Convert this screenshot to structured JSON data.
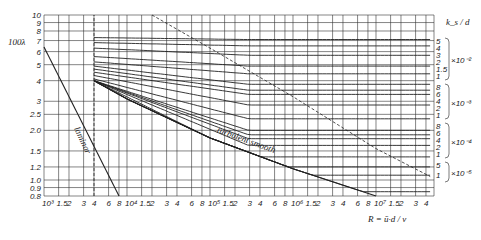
{
  "chart_data": {
    "type": "line",
    "title": "",
    "xlabel": "R = ū·d / ν",
    "ylabel": "100λ",
    "xscale": "log",
    "yscale": "log",
    "xlim": [
      1000,
      50000000
    ],
    "ylim": [
      0.8,
      10
    ],
    "grid": true,
    "x_ticks": [
      {
        "v": 1000,
        "label": "10³"
      },
      {
        "v": 1500,
        "label": "1.5"
      },
      {
        "v": 2000,
        "label": "2"
      },
      {
        "v": 3000,
        "label": "3"
      },
      {
        "v": 4000,
        "label": "4"
      },
      {
        "v": 6000,
        "label": "6"
      },
      {
        "v": 8000,
        "label": "8"
      },
      {
        "v": 10000,
        "label": "10⁴"
      },
      {
        "v": 15000,
        "label": "1.5"
      },
      {
        "v": 20000,
        "label": "2"
      },
      {
        "v": 30000,
        "label": "3"
      },
      {
        "v": 40000,
        "label": "4"
      },
      {
        "v": 60000,
        "label": "6"
      },
      {
        "v": 80000,
        "label": "8"
      },
      {
        "v": 100000,
        "label": "10⁵"
      },
      {
        "v": 150000,
        "label": "1.5"
      },
      {
        "v": 200000,
        "label": "2"
      },
      {
        "v": 300000,
        "label": "3"
      },
      {
        "v": 400000,
        "label": "4"
      },
      {
        "v": 600000,
        "label": "6"
      },
      {
        "v": 800000,
        "label": "8"
      },
      {
        "v": 1000000,
        "label": "10⁶"
      },
      {
        "v": 1500000,
        "label": "1.5"
      },
      {
        "v": 2000000,
        "label": "2"
      },
      {
        "v": 3000000,
        "label": "3"
      },
      {
        "v": 4000000,
        "label": "4"
      },
      {
        "v": 6000000,
        "label": "6"
      },
      {
        "v": 8000000,
        "label": "8"
      },
      {
        "v": 10000000,
        "label": "10⁷"
      },
      {
        "v": 15000000,
        "label": "1.5"
      },
      {
        "v": 20000000,
        "label": "2"
      },
      {
        "v": 30000000,
        "label": "3"
      },
      {
        "v": 40000000,
        "label": "4"
      }
    ],
    "y_ticks": [
      {
        "v": 10,
        "label": "10"
      },
      {
        "v": 9,
        "label": "9"
      },
      {
        "v": 8,
        "label": "8"
      },
      {
        "v": 7,
        "label": "7"
      },
      {
        "v": 6,
        "label": "6"
      },
      {
        "v": 5,
        "label": "5"
      },
      {
        "v": 4,
        "label": "4"
      },
      {
        "v": 3,
        "label": "3"
      },
      {
        "v": 2.5,
        "label": "2.5"
      },
      {
        "v": 2.0,
        "label": "2.0"
      },
      {
        "v": 1.5,
        "label": "1.5"
      },
      {
        "v": 1.2,
        "label": "1.2"
      },
      {
        "v": 1.0,
        "label": "1.0"
      },
      {
        "v": 0.9,
        "label": "0.9"
      },
      {
        "v": 0.8,
        "label": "0.8"
      }
    ],
    "right_axis": {
      "title": "k_s / d",
      "groups": [
        {
          "multiplier": "×10⁻²",
          "values": [
            5,
            4,
            3,
            2,
            1.5,
            1
          ]
        },
        {
          "multiplier": "×10⁻³",
          "values": [
            8,
            6,
            4,
            2,
            1
          ]
        },
        {
          "multiplier": "×10⁻⁴",
          "values": [
            8,
            6,
            4,
            2,
            1
          ]
        },
        {
          "multiplier": "×10⁻⁵",
          "values": [
            5,
            1
          ]
        }
      ]
    },
    "annotations": [
      {
        "text": "laminar",
        "position": "along laminar line, Re≈2–4×10³"
      },
      {
        "text": "turbulent smooth",
        "position": "along lowest curve, Re≈10⁵–10⁶"
      }
    ],
    "series": [
      {
        "name": "laminar (64/Re)",
        "style": "solid",
        "x": [
          1000,
          8000
        ],
        "y": [
          6.4,
          0.8
        ]
      },
      {
        "name": "transition boundary",
        "style": "dashed-vertical",
        "x": [
          4000,
          4000
        ],
        "y": [
          0.8,
          10
        ]
      },
      {
        "name": "fully rough limit",
        "style": "dashed",
        "x": [
          20000,
          100000,
          1000000,
          10000000,
          45000000
        ],
        "y": [
          10,
          6.3,
          3.2,
          1.55,
          1.05
        ]
      },
      {
        "name": "ks/d=5e-2",
        "x": [
          4000,
          50000000
        ],
        "y": [
          7.3,
          7.1
        ]
      },
      {
        "name": "ks/d=4e-2",
        "x": [
          4000,
          50000000
        ],
        "y": [
          6.8,
          6.5
        ]
      },
      {
        "name": "ks/d=3e-2",
        "x": [
          4000,
          50000000
        ],
        "y": [
          6.3,
          5.7
        ]
      },
      {
        "name": "ks/d=2e-2",
        "x": [
          4000,
          50000000
        ],
        "y": [
          5.6,
          4.9
        ]
      },
      {
        "name": "ks/d=1.5e-2",
        "x": [
          4000,
          50000000
        ],
        "y": [
          5.2,
          4.4
        ]
      },
      {
        "name": "ks/d=1e-2",
        "x": [
          4000,
          50000000
        ],
        "y": [
          4.9,
          3.8
        ]
      },
      {
        "name": "ks/d=8e-3",
        "x": [
          4000,
          50000000
        ],
        "y": [
          4.7,
          3.5
        ]
      },
      {
        "name": "ks/d=6e-3",
        "x": [
          4000,
          50000000
        ],
        "y": [
          4.5,
          3.3
        ]
      },
      {
        "name": "ks/d=4e-3",
        "x": [
          4000,
          50000000
        ],
        "y": [
          4.3,
          2.85
        ]
      },
      {
        "name": "ks/d=2e-3",
        "x": [
          4000,
          50000000
        ],
        "y": [
          4.1,
          2.35
        ]
      },
      {
        "name": "ks/d=1e-3",
        "x": [
          4000,
          50000000
        ],
        "y": [
          4.0,
          2.0
        ]
      },
      {
        "name": "ks/d=8e-4",
        "x": [
          4000,
          50000000
        ],
        "y": [
          4.0,
          1.88
        ]
      },
      {
        "name": "ks/d=6e-4",
        "x": [
          4000,
          50000000
        ],
        "y": [
          4.0,
          1.78
        ]
      },
      {
        "name": "ks/d=4e-4",
        "x": [
          4000,
          50000000
        ],
        "y": [
          4.0,
          1.62
        ]
      },
      {
        "name": "ks/d=2e-4",
        "x": [
          4000,
          50000000
        ],
        "y": [
          4.0,
          1.38
        ]
      },
      {
        "name": "ks/d=1e-4",
        "x": [
          4000,
          50000000
        ],
        "y": [
          4.0,
          1.2
        ]
      },
      {
        "name": "ks/d=5e-5",
        "x": [
          4000,
          50000000
        ],
        "y": [
          4.0,
          1.07
        ]
      },
      {
        "name": "ks/d=1e-5",
        "x": [
          4000,
          50000000
        ],
        "y": [
          4.0,
          0.85
        ]
      },
      {
        "name": "turbulent smooth",
        "x": [
          4000,
          10000,
          100000,
          1000000,
          10000000
        ],
        "y": [
          4.0,
          3.1,
          1.8,
          1.17,
          0.8
        ]
      }
    ]
  }
}
